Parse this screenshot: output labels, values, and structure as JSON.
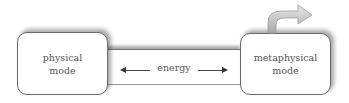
{
  "diagram": {
    "nodes": [
      {
        "id": "physical",
        "label_line1": "physical",
        "label_line2": "mode"
      },
      {
        "id": "metaphysical",
        "label_line1": "metaphysical",
        "label_line2": "mode"
      }
    ],
    "connector": {
      "label": "energy",
      "direction": "bidirectional"
    },
    "outgoing_arrow": {
      "from": "metaphysical",
      "style": "curved-up-right"
    }
  }
}
